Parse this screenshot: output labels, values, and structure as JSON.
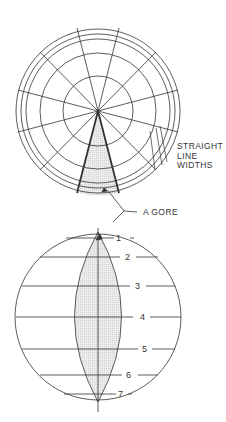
{
  "labels": {
    "straight_line_widths": [
      "STRAIGHT",
      "LINE",
      "WIDTHS"
    ],
    "gore": "A GORE"
  },
  "gore_numbers": [
    "1",
    "2",
    "3",
    "4",
    "5",
    "6",
    "7"
  ],
  "colors": {
    "line": "#333333",
    "fill": "#e6e6e6"
  }
}
